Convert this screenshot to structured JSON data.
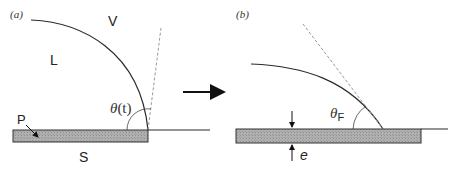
{
  "panels": [
    {
      "id": "a",
      "label": "(a)",
      "region_labels": {
        "vapor": "V",
        "liquid": "L",
        "solid": "S",
        "pattern": "P"
      },
      "angle_label_main": "θ",
      "angle_label_arg": "(t)",
      "angle_label_full": "θ(t)"
    },
    {
      "id": "b",
      "label": "(b)",
      "angle_label_main": "θ",
      "angle_label_sub": "F",
      "angle_label_full": "θF",
      "thickness_label": "e"
    }
  ],
  "transition_arrow": "→",
  "colors": {
    "line": "#2a2a2a",
    "dashed": "#9a9a9a",
    "substrate_fill": "#a9a9a9",
    "substrate_stroke": "#333333",
    "background": "#ffffff"
  }
}
